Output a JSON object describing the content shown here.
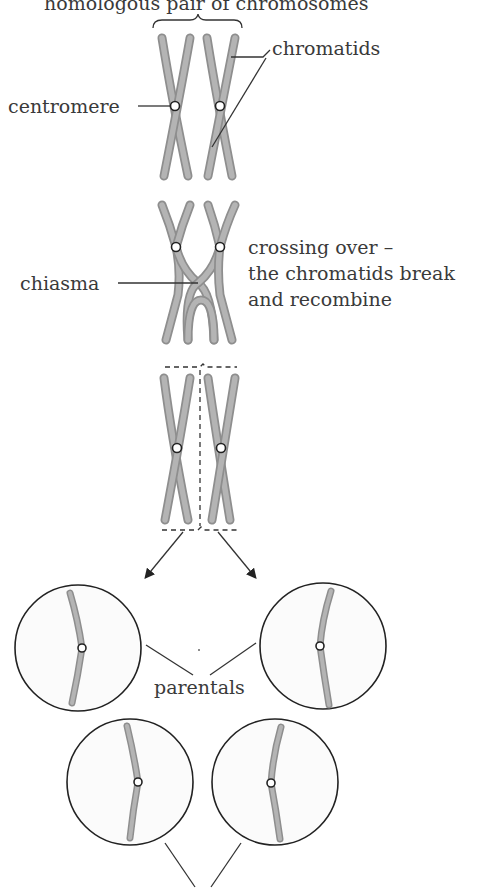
{
  "diagram": {
    "title": "homologous pair of chromosomes",
    "labels": {
      "chromatids": "chromatids",
      "centromere": "centromere",
      "crossing_over_1": "crossing over –",
      "crossing_over_2": "the chromatids break",
      "crossing_over_3": "and recombine",
      "chiasma": "chiasma",
      "parentals": "parentals"
    },
    "stages": [
      "homologous pair",
      "crossing over at chiasma",
      "separation of homologues",
      "four resulting cells (two parentals, two recombinants)"
    ],
    "colors": {
      "chromatid": "#a8a8a8",
      "outline": "#222222",
      "text": "#3a3a3a"
    }
  }
}
